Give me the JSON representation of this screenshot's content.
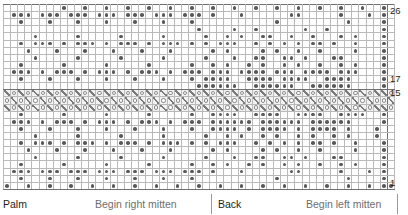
{
  "chart_data": {
    "type": "heatmap",
    "xlabel": "",
    "ylabel": "Row",
    "grid": true,
    "columns": 55,
    "rows": 26,
    "row_number_labels": [
      "26",
      "17",
      "15",
      "1"
    ],
    "row_numbers_shown": [
      26,
      17,
      15,
      1
    ],
    "legend": [
      {
        "key": "dot",
        "label": "contrast-colour stitch"
      },
      {
        "key": "yo",
        "label": "yarn over"
      },
      {
        "key": "dec",
        "label": "decrease"
      },
      {
        "key": "blank",
        "label": "main-colour stitch"
      }
    ],
    "lace_band_rows": [
      15,
      16,
      17
    ],
    "section_labels": [
      "Palm",
      "Begin right mitten",
      "Back",
      "Begin left mitten"
    ],
    "cells": [
      "........#..#..#..#..#..#..#..#..#..#..#..#..#..#..#..#..#..#.#",
      ".###.###.###.###.###.###.###.#...#......##.....#...#.#",
      "..#...#...#...#...#...#...#...........#.........#....#",
      "...........................#....#..#......#..#.......#",
      "....#.....#.....#.....#.....#..#.#..##..#..#...#.#...#",
      "..#.###.#.###.#.###.#.###.#.#.###..#.#.#.#.##.#..#...#",
      "...#...#...#...#...#...#.....#.#....#.#..#..#....#...#",
      "....#.....#.....#.....#.....#...#..##..##.#...##.....#",
      "..#.....#.....#.....#.....#..#.#..#.#..#.#..#..#.#...#",
      ".###.#.###.#.###.#.###.#.###.###.####.###.####.###...#",
      "..#...#...#...#...#...#...#.####..####.####..####....#",
      "...........................######..######..######....#",
      "qoqoqoqoqoqoqoqoqoqoqoqoqoqoqoqoqoqoqoqoqoqoqoqoqoqoq",
      "oqoqoqoqoqoqoqoqoqoqoqoqoqoqoqoqoqoqoqoqoqoqoqoqoqoqo",
      "qoqoqoqoqoqoqoqoqoqoqoqoqoqoqoqoqoqoqoqoqoqoqoqoqoqoq",
      "..#.....#.....#.....#.....#..####..####..####..####..#",
      ".###.#.###.#.###.#.###.#.###.######.######.######....#",
      "..#...#...#...#...#...#...#..####.#.####.#.####.#...#",
      "....#.....#.....#.....#.....#..#.#..#.#..#.#..#.#...#",
      "..#.###.#.###.#.###.#.###.#.#.###..#.#.#.#.##.#..#...#",
      "...#...#...#...#...#...#.....#.#....#.#..#..#....#...#",
      "....#.....#.....#.....#.....#...#..##..##.#...##.....#",
      "..#.....#.....#.....#.....#..#.#..#.#..#.#..#..#.#...#",
      ".###.###.###.###.###.###.###.#...#......##.....#...#.#",
      "..#...#...#...#...#...#...#...........#.........#....#",
      "#..#..#..#..#..#..#..#..#..#..#..#..#..#..#..#..#..#.#"
    ]
  },
  "captions": {
    "palm": "Palm",
    "begin_right": "Begin right mitten",
    "back": "Back",
    "begin_left": "Begin left mitten"
  },
  "colors": {
    "stitch_dot": "#59595b",
    "grid_line": "#b9b9ba",
    "grid_line_bold": "#6f6f70",
    "lace_background": "#f2f2f2",
    "text": "#231f20",
    "text_light": "#6d6e70"
  }
}
